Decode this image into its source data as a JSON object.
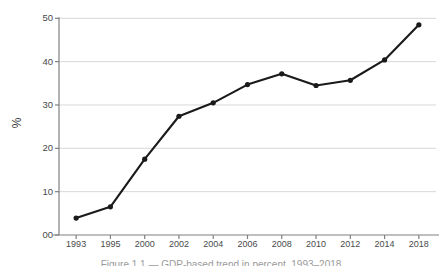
{
  "chart_data": {
    "type": "line",
    "title": "",
    "xlabel": "",
    "ylabel": "%",
    "categories": [
      "1993",
      "1995",
      "2000",
      "2002",
      "2004",
      "2006",
      "2008",
      "2010",
      "2012",
      "2014",
      "2018"
    ],
    "values": [
      3.9,
      6.5,
      17.5,
      27.4,
      30.5,
      34.7,
      37.2,
      34.5,
      35.7,
      40.4,
      48.5
    ],
    "series": [
      {
        "name": "",
        "values": [
          3.9,
          6.5,
          17.5,
          27.4,
          30.5,
          34.7,
          37.2,
          34.5,
          35.7,
          40.4,
          48.5
        ]
      }
    ],
    "ylim": [
      0,
      50
    ],
    "yticks": [
      0,
      10,
      20,
      30,
      40,
      50
    ],
    "ytick_labels": [
      "00",
      "10",
      "20",
      "30",
      "40",
      "50"
    ],
    "grid": true,
    "grid_axis": "y",
    "legend": "none",
    "markers": true,
    "line_color": "#1a1a1a",
    "marker_color": "#1a1a1a",
    "grid_color": "#d8d8d8",
    "axis_color": "#808080",
    "background": "#ffffff"
  },
  "caption": {
    "text": "Figure 1.1 — GDP-based trend in percent, 1993–2018"
  }
}
